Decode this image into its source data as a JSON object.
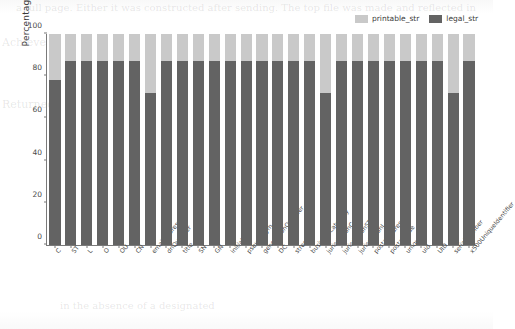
{
  "chart_data": {
    "type": "bar",
    "stacked": true,
    "title": "",
    "xlabel": "",
    "ylabel": "Percentage(%)",
    "ylim": [
      0,
      100
    ],
    "yticks": [
      0,
      20,
      40,
      60,
      80,
      100
    ],
    "grid": false,
    "legend_position": "top-right",
    "categories": [
      "C",
      "ST",
      "L",
      "O",
      "OU",
      "CN",
      "emailAddress",
      "dnQualifier",
      "title",
      "SN",
      "GN",
      "initials",
      "pseudonym",
      "generationQualifier",
      "DC",
      "street",
      "businessCategory",
      "jurisdictionC",
      "jurisdictionST",
      "jurisdictionL",
      "postalAddress",
      "postalCode",
      "uniqueId",
      "uid",
      "UID",
      "serialNumber",
      "x500UniqueIdentifier"
    ],
    "series": [
      {
        "name": "legal_str",
        "color": "#636363",
        "values": [
          78,
          87,
          87,
          87,
          87,
          87,
          72,
          87,
          87,
          87,
          87,
          87,
          87,
          87,
          87,
          87,
          87,
          72,
          87,
          87,
          87,
          87,
          87,
          87,
          87,
          72,
          87
        ]
      },
      {
        "name": "printable_str",
        "color": "#c9c9c9",
        "values": [
          22,
          13,
          13,
          13,
          13,
          13,
          28,
          13,
          13,
          13,
          13,
          13,
          13,
          13,
          13,
          13,
          13,
          28,
          13,
          13,
          13,
          13,
          13,
          13,
          13,
          28,
          13
        ]
      }
    ]
  },
  "legend": {
    "entries": [
      {
        "label": "printable_str",
        "color": "#c9c9c9"
      },
      {
        "label": "legal_str",
        "color": "#636363"
      }
    ]
  },
  "axes": {
    "y_axis_label": "Percentage(%)",
    "y_tick_labels": [
      "0",
      "20",
      "40",
      "60",
      "80",
      "100"
    ]
  },
  "background_text": {
    "top_line": "a full page. Either it was constructed after sending. The top file was made and reflected in",
    "left_lines": [
      "Achieve",
      "Returned"
    ],
    "bottom_line": "in the absence of a designated"
  }
}
